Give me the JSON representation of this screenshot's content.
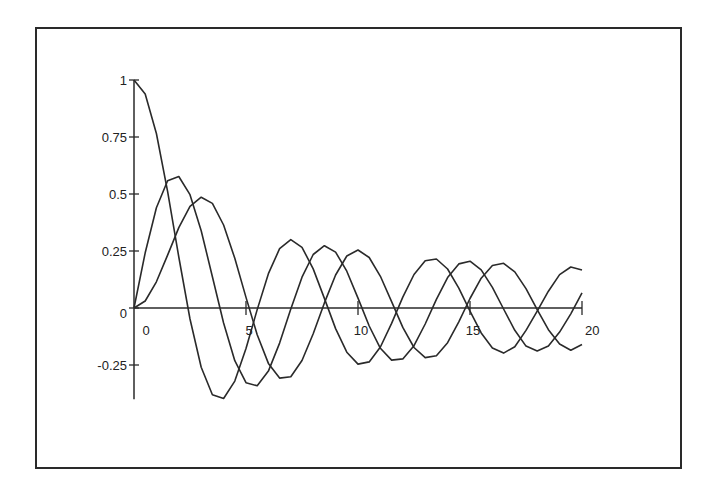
{
  "chart_data": {
    "type": "line",
    "title": "",
    "xlabel": "",
    "ylabel": "",
    "xlim": [
      0,
      20
    ],
    "ylim": [
      -0.4,
      1
    ],
    "grid": false,
    "legend": null,
    "x_ticks": [
      0,
      5,
      10,
      15,
      20
    ],
    "x_tick_labels": [
      "0",
      "5",
      "10",
      "15",
      "20"
    ],
    "y_ticks": [
      1,
      0.75,
      0.5,
      0.25,
      0,
      -0.25
    ],
    "y_tick_labels": [
      "1",
      "0.75",
      "0.5",
      "0.25",
      "0",
      "-0.25"
    ],
    "line_color": "#2a2a2a",
    "x": [
      0,
      0.5,
      1,
      1.5,
      2,
      2.5,
      3,
      3.5,
      4,
      4.5,
      5,
      5.5,
      6,
      6.5,
      7,
      7.5,
      8,
      8.5,
      9,
      9.5,
      10,
      10.5,
      11,
      11.5,
      12,
      12.5,
      13,
      13.5,
      14,
      14.5,
      15,
      15.5,
      16,
      16.5,
      17,
      17.5,
      18,
      18.5,
      19,
      19.5,
      20
    ],
    "series": [
      {
        "name": "J0",
        "values": [
          1,
          0.9385,
          0.7652,
          0.5118,
          0.2239,
          -0.0484,
          -0.2601,
          -0.3801,
          -0.3971,
          -0.3205,
          -0.1776,
          -0.0068,
          0.1506,
          0.2601,
          0.3001,
          0.2663,
          0.1717,
          0.0419,
          -0.0903,
          -0.1939,
          -0.2459,
          -0.2366,
          -0.1712,
          -0.0677,
          0.0477,
          0.1469,
          0.2069,
          0.215,
          0.1711,
          0.0875,
          -0.0142,
          -0.1092,
          -0.1749,
          -0.1978,
          -0.1699,
          -0.0984,
          -0.0134,
          0.0738,
          0.1466,
          0.18,
          0.167
        ]
      },
      {
        "name": "J1",
        "values": [
          0,
          0.2423,
          0.4401,
          0.5579,
          0.5767,
          0.4971,
          0.3391,
          0.1374,
          -0.066,
          -0.2311,
          -0.3276,
          -0.3414,
          -0.2767,
          -0.1538,
          -0.0047,
          0.1352,
          0.2346,
          0.2731,
          0.2453,
          0.1613,
          0.0435,
          -0.0789,
          -0.1768,
          -0.2284,
          -0.2234,
          -0.1655,
          -0.0703,
          0.038,
          0.1334,
          0.1934,
          0.2051,
          0.1672,
          0.0904,
          -0.0044,
          -0.0977,
          -0.1672,
          -0.188,
          -0.1663,
          -0.1057,
          -0.0253,
          0.0668
        ]
      },
      {
        "name": "J2",
        "values": [
          0,
          0.0306,
          0.1149,
          0.2321,
          0.3528,
          0.4461,
          0.4861,
          0.4586,
          0.3641,
          0.2178,
          0.0466,
          -0.1173,
          -0.2429,
          -0.3074,
          -0.3014,
          -0.2303,
          -0.113,
          0.0223,
          0.1448,
          0.2279,
          0.2546,
          0.2216,
          0.139,
          0.0279,
          -0.0849,
          -0.1734,
          -0.2177,
          -0.2094,
          -0.152,
          -0.0609,
          0.0415,
          0.1308,
          0.1862,
          0.1961,
          0.1584,
          0.0849,
          -0.0075,
          -0.0953,
          -0.1578,
          -0.185,
          -0.1603
        ]
      }
    ]
  }
}
